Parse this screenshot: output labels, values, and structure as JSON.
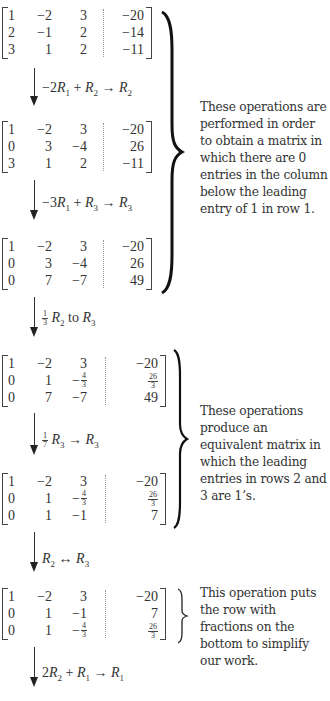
{
  "matrices": [
    {
      "rows": [
        [
          "1",
          "−2",
          "3",
          "−20"
        ],
        [
          "2",
          "−1",
          "2",
          "−14"
        ],
        [
          "3",
          "1",
          "2",
          "−11"
        ]
      ]
    },
    {
      "rows": [
        [
          "1",
          "−2",
          "3",
          "−20"
        ],
        [
          "0",
          "3",
          "−4",
          "26"
        ],
        [
          "3",
          "1",
          "2",
          "−11"
        ]
      ]
    },
    {
      "rows": [
        [
          "1",
          "−2",
          "3",
          "−20"
        ],
        [
          "0",
          "3",
          "−4",
          "26"
        ],
        [
          "0",
          "7",
          "−7",
          "49"
        ]
      ]
    },
    {
      "rows": [
        [
          "1",
          "−2",
          "3",
          "−20"
        ],
        [
          "0",
          "1",
          "−4/3",
          "26/3"
        ],
        [
          "0",
          "7",
          "−7",
          "49"
        ]
      ]
    },
    {
      "rows": [
        [
          "1",
          "−2",
          "3",
          "−20"
        ],
        [
          "0",
          "1",
          "−4/3",
          "26/3"
        ],
        [
          "0",
          "1",
          "−1",
          "7"
        ]
      ]
    },
    {
      "rows": [
        [
          "1",
          "−2",
          "3",
          "−20"
        ],
        [
          "0",
          "1",
          "−1",
          "7"
        ],
        [
          "0",
          "1",
          "−4/3",
          "26/3"
        ]
      ]
    }
  ],
  "operations": [
    {
      "coef": "−2",
      "a": "R",
      "a_sub": "1",
      "plus": " + ",
      "b": "R",
      "b_sub": "2",
      "arrow": " → ",
      "c": "R",
      "c_sub": "2"
    },
    {
      "coef": "−3",
      "a": "R",
      "a_sub": "1",
      "plus": " + ",
      "b": "R",
      "b_sub": "3",
      "arrow": " → ",
      "c": "R",
      "c_sub": "3"
    },
    {
      "frac_num": "1",
      "frac_den": "3",
      "a": "R",
      "a_sub": "2",
      "text": " to ",
      "c": "R",
      "c_sub": "3"
    },
    {
      "frac_num": "1",
      "frac_den": "7",
      "a": "R",
      "a_sub": "3",
      "arrow": " → ",
      "c": "R",
      "c_sub": "3"
    },
    {
      "a": "R",
      "a_sub": "2",
      "arrow": " ↔ ",
      "c": "R",
      "c_sub": "3"
    },
    {
      "coef": "2",
      "a": "R",
      "a_sub": "2",
      "plus": " + ",
      "b": "R",
      "b_sub": "1",
      "arrow": " → ",
      "c": "R",
      "c_sub": "1"
    }
  ],
  "notes": [
    "These operations are performed in order to obtain a matrix in which there are 0 entries in the column below the leading entry of 1 in row 1.",
    "These operations produce an equivalent matrix in which the leading entries in rows 2 and 3 are 1’s.",
    "This operation puts the row with fractions on the bottom to simplify our work."
  ],
  "fractions": {
    "neg_four_thirds": {
      "sign": "−",
      "num": "4",
      "den": "3"
    },
    "twentysix_thirds": {
      "num": "26",
      "den": "3"
    }
  }
}
